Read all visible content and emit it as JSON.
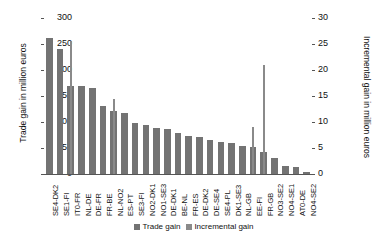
{
  "chart_data": {
    "type": "bar",
    "title": "",
    "subtitle": "",
    "xlabel": "",
    "ylabel": "Trade gain in million euros",
    "ylabel_right": "Incremental gain in million euros",
    "ylim": [
      0,
      300
    ],
    "ylim_right": [
      0,
      30
    ],
    "yticks": [
      0,
      50,
      100,
      150,
      200,
      250,
      300
    ],
    "yticks_right": [
      0,
      5,
      10,
      15,
      20,
      25,
      30
    ],
    "grid": false,
    "legend_position": "bottom",
    "categories": [
      "SE4-DK2",
      "SE1-FI",
      "IT0-FR",
      "NL-DE",
      "DE-FR",
      "FR-BE",
      "NL-NO2",
      "ES-PT",
      "SE3-FI",
      "NO2-DK1",
      "NO1-SE3",
      "DE-DK1",
      "BE-NL",
      "FR-ES",
      "DE-DK2",
      "DE-SE4",
      "SE4-PL",
      "DK1-SE3",
      "NL-GB",
      "EE-FI",
      "FR-GB",
      "NO3-SE2",
      "NO4-SE1",
      "AT0-DE",
      "NO4-SE2"
    ],
    "series": [
      {
        "name": "Trade gain",
        "axis": "left",
        "color": "#737373",
        "values": [
          262,
          240,
          170,
          170,
          165,
          130,
          122,
          118,
          98,
          95,
          88,
          86,
          78,
          74,
          72,
          66,
          62,
          60,
          54,
          52,
          42,
          30,
          16,
          14,
          4
        ]
      },
      {
        "name": "Incremental gain",
        "axis": "right",
        "color": "#8a8a8a",
        "values": [
          0,
          0,
          25.5,
          0,
          0,
          0,
          14.5,
          0,
          0,
          0,
          0,
          0,
          0,
          0,
          0,
          0,
          0,
          0,
          0,
          9.0,
          21.0,
          0,
          0,
          0,
          0
        ]
      }
    ],
    "legend": [
      "Trade gain",
      "Incremental gain"
    ]
  },
  "axes": {
    "left_title": "Trade gain in million euros",
    "right_title": "Incremental gain in million euros"
  },
  "legend": {
    "items": [
      {
        "label": "Trade gain",
        "color": "#737373"
      },
      {
        "label": "Incremental gain",
        "color": "#8a8a8a"
      }
    ]
  }
}
